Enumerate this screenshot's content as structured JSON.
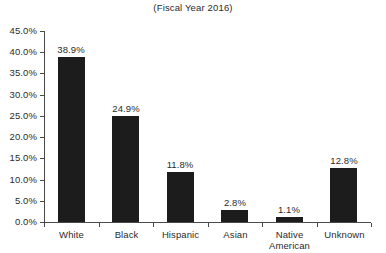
{
  "chart_data": {
    "type": "bar",
    "title": "(Fiscal Year 2016)",
    "xlabel": "",
    "ylabel": "",
    "categories": [
      "White",
      "Black",
      "Hispanic",
      "Asian",
      "Native American",
      "Unknown"
    ],
    "values": [
      38.9,
      24.9,
      11.8,
      2.8,
      1.1,
      12.8
    ],
    "value_labels": [
      "38.9%",
      "24.9%",
      "11.8%",
      "2.8%",
      "1.1%",
      "12.8%"
    ],
    "ylim": [
      0,
      45
    ],
    "ytick_values": [
      0,
      5,
      10,
      15,
      20,
      25,
      30,
      35,
      40,
      45
    ],
    "ytick_labels": [
      "0.0%",
      "5.0%",
      "10.0%",
      "15.0%",
      "20.0%",
      "25.0%",
      "30.0%",
      "35.0%",
      "40.0%",
      "45.0%"
    ],
    "grid": false,
    "legend": false,
    "bar_color": "#1c1c1c",
    "axis_color": "#4a4a4a",
    "background": "#ffffff"
  }
}
